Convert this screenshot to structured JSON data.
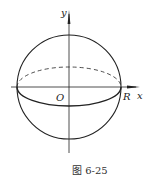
{
  "figure": {
    "caption": "图 6-25",
    "labels": {
      "y_axis": "y",
      "x_axis": "x",
      "origin": "O",
      "radius": "R"
    },
    "colors": {
      "stroke": "#222222",
      "background": "#ffffff"
    }
  }
}
